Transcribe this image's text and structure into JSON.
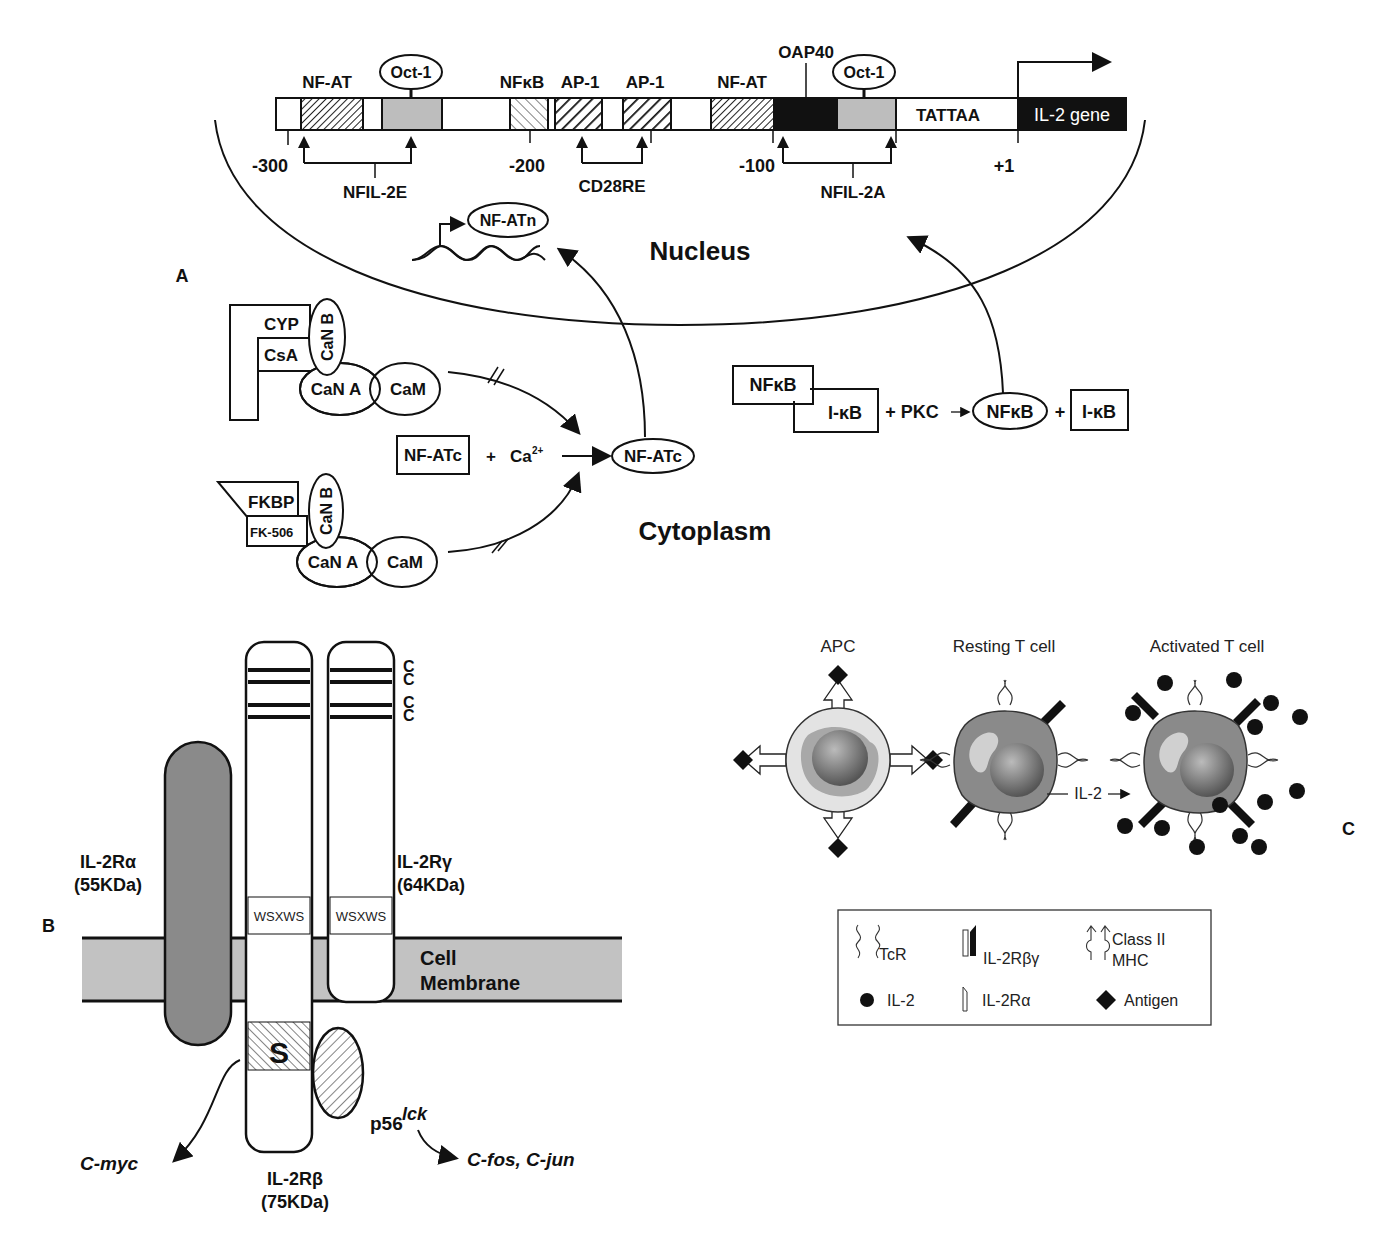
{
  "panel_a": {
    "label": "A",
    "promoter": {
      "elements": [
        {
          "name": "NF-AT",
          "pattern": "fine-hatch"
        },
        {
          "name": "Oct-1",
          "pattern": "stipple",
          "oval": true
        },
        {
          "name": "NFκB",
          "pattern": "light-hatch"
        },
        {
          "name": "AP-1",
          "pattern": "bold-hatch"
        },
        {
          "name": "AP-1",
          "pattern": "bold-hatch"
        },
        {
          "name": "NF-AT",
          "pattern": "fine-hatch"
        },
        {
          "name": "OAP40",
          "pattern": "solid-black"
        },
        {
          "name": "Oct-1",
          "pattern": "stipple",
          "oval": true
        },
        {
          "name": "TATTAA",
          "pattern": "white"
        },
        {
          "name": "IL-2 gene",
          "pattern": "solid-black"
        }
      ],
      "labels": {
        "nfat1": "NF-AT",
        "oct1a": "Oct-1",
        "nfkb": "NFκB",
        "ap1a": "AP-1",
        "ap1b": "AP-1",
        "nfat2": "NF-AT",
        "oap40": "OAP40",
        "oct1b": "Oct-1",
        "tattaa": "TATTAA",
        "gene": "IL-2 gene"
      },
      "positions": [
        "-300",
        "-200",
        "-100",
        "+1"
      ],
      "regions": {
        "nfil2e": "NFIL-2E",
        "cd28re": "CD28RE",
        "nfil2a": "NFIL-2A"
      }
    },
    "nucleus_label": "Nucleus",
    "cytoplasm_label": "Cytoplasm",
    "nfatn": "NF-ATn",
    "complex_top": {
      "cyp": "CYP",
      "csa": "CsA",
      "canb": "CaN B",
      "cana": "CaN A",
      "cam": "CaM"
    },
    "complex_bottom": {
      "fkbp": "FKBP",
      "fk506": "FK-506",
      "canb": "CaN B",
      "cana": "CaN A",
      "cam": "CaM"
    },
    "reaction_nfat": {
      "reactant": "NF-ATc",
      "plus": "+",
      "ion": "Ca",
      "ion_sup": "2+",
      "product": "NF-ATc"
    },
    "reaction_nfkb": {
      "nfkb": "NFκB",
      "ikb": "I-κB",
      "plus_pkc": "+ PKC",
      "product": "NFκB",
      "plus": "+",
      "ikb2": "I-κB"
    }
  },
  "panel_b": {
    "label": "B",
    "il2ra": {
      "name": "IL-2Rα",
      "mass": "(55KDa)"
    },
    "il2rg": {
      "name": "IL-2Rγ",
      "mass": "(64KDa)"
    },
    "il2rb": {
      "name": "IL-2Rβ",
      "mass": "(75KDa)"
    },
    "motif": "WSXWS",
    "cys": [
      "C",
      "C",
      "C",
      "C"
    ],
    "s_region": "S",
    "membrane": {
      "line1": "Cell",
      "line2": "Membrane"
    },
    "kinase": {
      "base": "p56",
      "sup": "lck"
    },
    "targets": {
      "left": "C-myc",
      "right": "C-fos, C-jun"
    }
  },
  "panel_c": {
    "label": "C",
    "cells": [
      "APC",
      "Resting T cell",
      "Activated T cell"
    ],
    "arrow_label": "IL-2",
    "legend": [
      {
        "icon": "tcr-icon",
        "label": "TcR"
      },
      {
        "icon": "il2rbg-icon",
        "label": "IL-2Rβγ"
      },
      {
        "icon": "mhc-icon",
        "label": "Class II",
        "label2": "MHC"
      },
      {
        "icon": "il2-dot-icon",
        "label": "IL-2"
      },
      {
        "icon": "il2ra-icon",
        "label": "IL-2Rα"
      },
      {
        "icon": "antigen-diamond-icon",
        "label": "Antigen"
      }
    ]
  }
}
